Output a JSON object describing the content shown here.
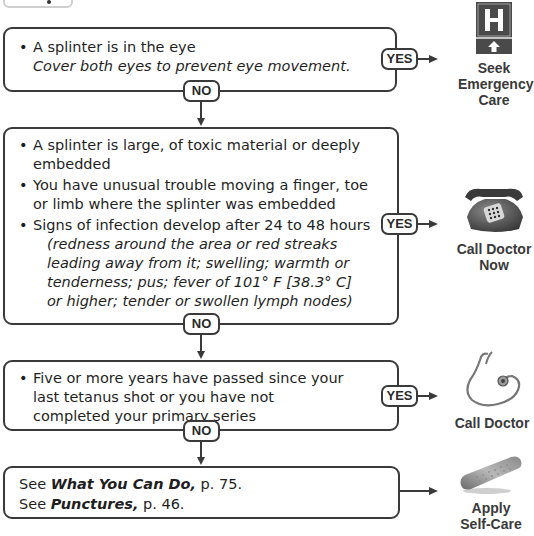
{
  "top_tab": {
    "icon": "dot"
  },
  "steps": [
    {
      "items": [
        {
          "text": "A splinter is in the eye",
          "note": "Cover both eyes to prevent eye movement."
        }
      ],
      "yes_label": "YES",
      "no_label": "NO",
      "outcome": {
        "icon": "hospital-sign-icon",
        "label_lines": [
          "Seek",
          "Emergency",
          "Care"
        ]
      }
    },
    {
      "items": [
        {
          "text": "A splinter is large, of toxic material or deeply embedded"
        },
        {
          "text": "You have unusual trouble moving a finger, toe or limb where the splinter was embedded"
        },
        {
          "text": "Signs of infection develop after 24 to 48 hours",
          "note": "(redness around the area or red streaks leading away from it; swelling; warmth or tenderness; pus; fever of 101° F [38.3° C] or higher; tender or swollen lymph nodes)"
        }
      ],
      "yes_label": "YES",
      "no_label": "NO",
      "outcome": {
        "icon": "telephone-icon",
        "label_lines": [
          "Call Doctor",
          "Now"
        ]
      }
    },
    {
      "items": [
        {
          "text": "Five or more years have passed since your last tetanus shot or you have not completed your primary series"
        }
      ],
      "yes_label": "YES",
      "no_label": "NO",
      "outcome": {
        "icon": "stethoscope-icon",
        "label_lines": [
          "Call Doctor"
        ]
      }
    }
  ],
  "final": {
    "lines": [
      {
        "prefix": "See ",
        "title": "What You Can Do,",
        "suffix": " p. 75."
      },
      {
        "prefix": "See ",
        "title": "Punctures,",
        "suffix": " p. 46."
      }
    ],
    "outcome": {
      "icon": "bandage-icon",
      "label_lines": [
        "Apply",
        "Self-Care"
      ]
    }
  },
  "colors": {
    "line": "#3a3a3a",
    "text": "#1f1f1f",
    "sign_fill": "#4a4a4a"
  }
}
